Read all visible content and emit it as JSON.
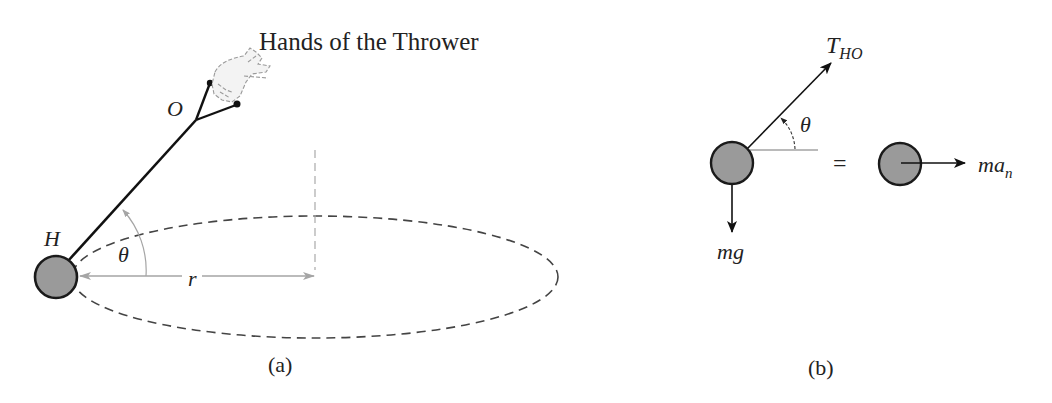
{
  "panel_a": {
    "title_label": "Hands of the Thrower",
    "point_O": "O",
    "point_H": "H",
    "angle_label": "θ",
    "radius_label": "r",
    "caption": "(a)"
  },
  "panel_b": {
    "tension_label_main": "T",
    "tension_label_sub": "HO",
    "angle_label": "θ",
    "weight_label": "mg",
    "equals": "=",
    "inertial_label_main": "ma",
    "inertial_label_sub": "n",
    "caption": "(b)"
  },
  "colors": {
    "ball_fill": "#9a9a9a",
    "ball_stroke": "#1a1a1a",
    "dashed_path": "#444444",
    "dimension_gray": "#9e9e9e",
    "line_black": "#111111"
  }
}
